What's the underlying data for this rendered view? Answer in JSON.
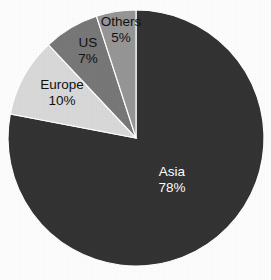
{
  "chart_data": {
    "type": "pie",
    "title": "",
    "subtitle": "",
    "xlabel": "",
    "ylabel": "",
    "legend_position": "none",
    "grid": false,
    "value_unit": "%",
    "start_angle_deg": 0,
    "direction": "clockwise",
    "categories": [
      "Asia",
      "Europe",
      "US",
      "Others"
    ],
    "values": [
      78,
      10,
      7,
      5
    ],
    "colors": [
      "#333333",
      "#d9d9d9",
      "#787878",
      "#969696"
    ],
    "slices": [
      {
        "name": "Asia",
        "label": "Asia",
        "value": 78,
        "value_label": "78%",
        "color": "#333333",
        "text_color": "#ffffff",
        "label_x": 172,
        "label_y": 172,
        "percent_x": 172,
        "percent_y": 188
      },
      {
        "name": "Europe",
        "label": "Europe",
        "value": 10,
        "value_label": "10%",
        "color": "#d9d9d9",
        "text_color": "#111111",
        "label_x": 62,
        "label_y": 85,
        "percent_x": 62,
        "percent_y": 101
      },
      {
        "name": "US",
        "label": "US",
        "value": 7,
        "value_label": "7%",
        "color": "#787878",
        "text_color": "#111111",
        "label_x": 88,
        "label_y": 43,
        "percent_x": 88,
        "percent_y": 59
      },
      {
        "name": "Others",
        "label": "Others",
        "value": 5,
        "value_label": "5%",
        "color": "#969696",
        "text_color": "#111111",
        "label_x": 121,
        "label_y": 22,
        "percent_x": 121,
        "percent_y": 38
      }
    ],
    "geometry": {
      "center_x": 136,
      "center_y": 138,
      "radius": 128
    },
    "background_color": "#fdfdfd"
  }
}
